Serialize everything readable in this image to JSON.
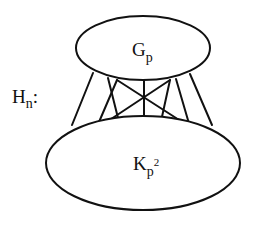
{
  "diagram": {
    "graph_label": {
      "main": "H",
      "sub": "n",
      "suffix": ":"
    },
    "nodes": [
      {
        "id": "top",
        "label_main": "G",
        "label_sub": "p",
        "label_sup": "",
        "cx": 143,
        "cy": 48,
        "rx": 67,
        "ry": 32
      },
      {
        "id": "bottom",
        "label_main": "K",
        "label_sub": "p",
        "label_sup": "2",
        "cx": 143,
        "cy": 163,
        "rx": 97,
        "ry": 47
      }
    ],
    "edges": [
      {
        "x1": 93,
        "y1": 73,
        "x2": 72,
        "y2": 125
      },
      {
        "x1": 108,
        "y1": 78,
        "x2": 120,
        "y2": 126
      },
      {
        "x1": 117,
        "y1": 80,
        "x2": 96,
        "y2": 129
      },
      {
        "x1": 117,
        "y1": 80,
        "x2": 190,
        "y2": 127
      },
      {
        "x1": 144,
        "y1": 81,
        "x2": 144,
        "y2": 126
      },
      {
        "x1": 170,
        "y1": 80,
        "x2": 96,
        "y2": 129
      },
      {
        "x1": 170,
        "y1": 80,
        "x2": 160,
        "y2": 126
      },
      {
        "x1": 176,
        "y1": 79,
        "x2": 190,
        "y2": 127
      },
      {
        "x1": 190,
        "y1": 74,
        "x2": 212,
        "y2": 125
      }
    ],
    "colors": {
      "stroke": "#111111",
      "background": "#ffffff"
    }
  }
}
